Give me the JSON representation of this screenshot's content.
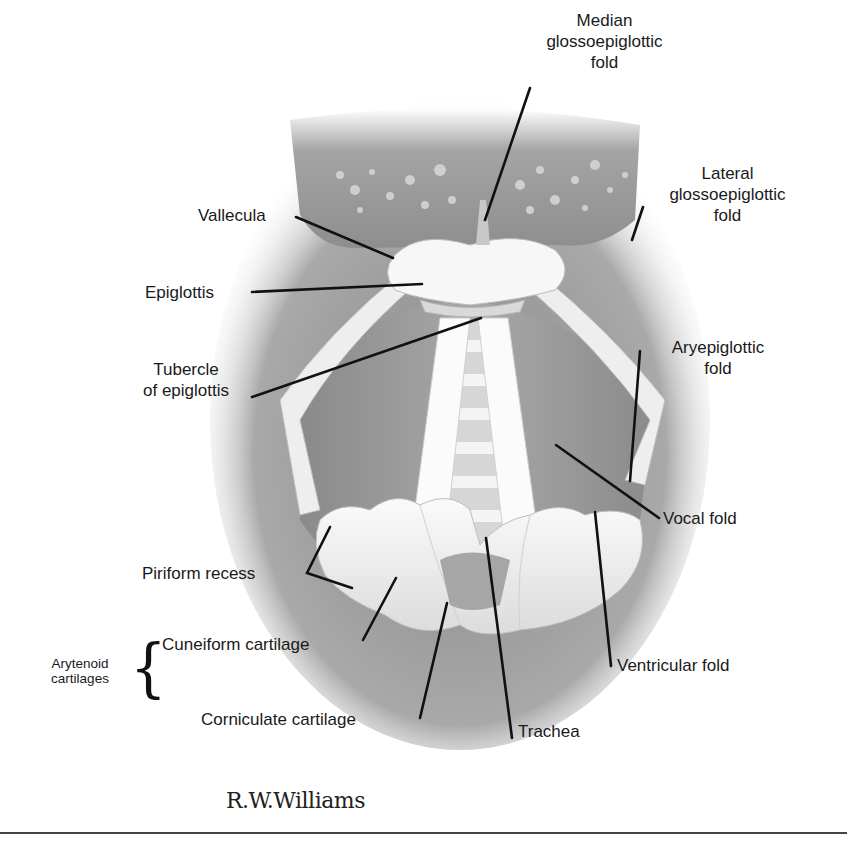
{
  "figure": {
    "colors": {
      "background": "#ffffff",
      "tissue_dark": "#7a7a7a",
      "tissue_mid": "#a9a9a9",
      "cartilage": "#f2f2f2",
      "leader_lines": "#111111"
    }
  },
  "labels": {
    "median_glossoepiglottic_fold": [
      "Median",
      "glossoepiglottic",
      "fold"
    ],
    "lateral_glossoepiglottic_fold": [
      "Lateral",
      "glossoepiglottic",
      "fold"
    ],
    "vallecula": "Vallecula",
    "epiglottis": "Epiglottis",
    "tubercle_of_epiglottis": [
      "Tubercle",
      "of epiglottis"
    ],
    "aryepiglottic_fold": [
      "Aryepiglottic",
      "fold"
    ],
    "vocal_fold": "Vocal fold",
    "piriform_recess": "Piriform recess",
    "arytenoid_cartilages": [
      "Arytenoid",
      "cartilages"
    ],
    "cuneiform_cartilage": "Cuneiform cartilage",
    "corniculate_cartilage": "Corniculate cartilage",
    "ventricular_fold": "Ventricular fold",
    "trachea": "Trachea"
  },
  "signature": "R.W.Williams"
}
